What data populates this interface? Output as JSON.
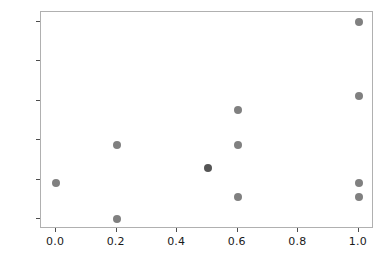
{
  "chart_data": {
    "type": "scatter",
    "title": "",
    "xlabel": "",
    "ylabel": "",
    "xlim": [
      -0.05,
      1.05
    ],
    "ylim": [
      -0.05,
      1.05
    ],
    "grid": false,
    "legend": null,
    "xticks": [
      0.0,
      0.2,
      0.4,
      0.6,
      0.8,
      1.0
    ],
    "yticks": [
      0.0,
      0.2,
      0.4,
      0.6,
      0.8,
      1.0
    ],
    "xtick_labels": [
      "0.0",
      "0.2",
      "0.4",
      "0.6",
      "0.8",
      "1.0"
    ],
    "ytick_labels": [
      "0.0",
      "0.2",
      "0.4",
      "0.6",
      "0.8",
      "1.0"
    ],
    "marker_color": "#808080",
    "marker_color_overlap": "#555555",
    "frame_color": "#b0b0b0",
    "background_color": "#ffffff",
    "points": [
      {
        "x": 0.0,
        "y": 0.185,
        "overlap": false
      },
      {
        "x": 0.2,
        "y": 0.375,
        "overlap": false
      },
      {
        "x": 0.2,
        "y": 0.0,
        "overlap": false
      },
      {
        "x": 0.5,
        "y": 0.26,
        "overlap": true
      },
      {
        "x": 0.6,
        "y": 0.555,
        "overlap": false
      },
      {
        "x": 0.6,
        "y": 0.375,
        "overlap": false
      },
      {
        "x": 0.6,
        "y": 0.11,
        "overlap": false
      },
      {
        "x": 1.0,
        "y": 1.0,
        "overlap": false
      },
      {
        "x": 1.0,
        "y": 0.625,
        "overlap": false
      },
      {
        "x": 1.0,
        "y": 0.185,
        "overlap": false
      },
      {
        "x": 1.0,
        "y": 0.11,
        "overlap": false
      }
    ]
  }
}
